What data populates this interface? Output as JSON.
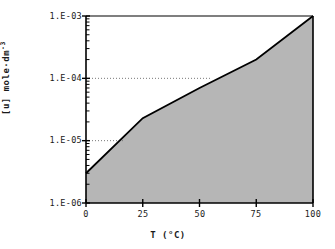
{
  "chart_data": {
    "type": "area",
    "title": "",
    "subtitle": "",
    "xlabel": "T (°C)",
    "ylabel": "[u] mole·dm-3",
    "ylabel_base": "[u] mole·dm",
    "ylabel_exponent": "-3",
    "xlim": [
      0,
      100
    ],
    "ylim": [
      1e-06,
      0.001
    ],
    "yscale": "log",
    "xscale": "linear",
    "grid": false,
    "legend": null,
    "x_ticks": [
      0,
      25,
      50,
      75,
      100
    ],
    "x_tick_labels": [
      "0",
      "25",
      "50",
      "75",
      "100"
    ],
    "y_ticks": [
      0.001,
      0.0001,
      1e-05,
      1e-06
    ],
    "y_tick_labels": [
      "1.E-03",
      "1.E-04",
      "1.E-05",
      "1.E-06"
    ],
    "y_minor_ticks": true,
    "series": [
      {
        "name": "solubility",
        "fill": true,
        "fill_color": "#b6b6b6",
        "line_color": "#000000",
        "x": [
          0,
          25,
          50,
          75,
          100
        ],
        "values": [
          3e-06,
          2.3e-05,
          7e-05,
          0.0002,
          0.001
        ]
      }
    ],
    "annotations": [
      {
        "name": "guide-line-1e-4",
        "type": "dotted-horizontal",
        "y": 0.0001,
        "x_start": 0,
        "x_end": 55,
        "color": "#777777"
      },
      {
        "name": "guide-line-1e-5",
        "type": "dotted-horizontal",
        "y": 1e-05,
        "x_start": 0,
        "x_end": 17,
        "color": "#777777"
      }
    ],
    "colors": {
      "axis": "#000000",
      "fill": "#b6b6b6",
      "curve": "#000000",
      "guide": "#777777",
      "background": "#ffffff",
      "text": "#1a1a1a"
    }
  },
  "axes": {
    "x_title": "T (°C)",
    "y_title_base": "[u] mole·dm",
    "y_title_exp": "-3"
  },
  "ticks": {
    "y": [
      {
        "label": "1.E-03"
      },
      {
        "label": "1.E-04"
      },
      {
        "label": "1.E-05"
      },
      {
        "label": "1.E-06"
      }
    ],
    "x": [
      {
        "label": "0"
      },
      {
        "label": "25"
      },
      {
        "label": "50"
      },
      {
        "label": "75"
      },
      {
        "label": "100"
      }
    ]
  }
}
